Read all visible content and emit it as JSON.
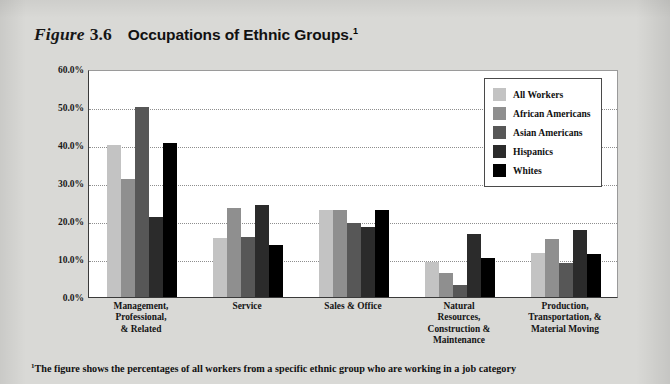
{
  "figure": {
    "label_word": "Figure",
    "number": "3.6",
    "title": "Occupations of Ethnic Groups.",
    "title_footnote_marker": "1"
  },
  "footnote": {
    "marker": "1",
    "text": "The figure shows the percentages of all workers from a specific ethnic group who are working in a job category"
  },
  "legend": {
    "position": "top-right",
    "items": [
      {
        "label": "All Workers",
        "color": "#c3c3c3"
      },
      {
        "label": "African Americans",
        "color": "#8f8f8f"
      },
      {
        "label": "Asian Americans",
        "color": "#575757"
      },
      {
        "label": "Hispanics",
        "color": "#2b2b2b"
      },
      {
        "label": "Whites",
        "color": "#000000"
      }
    ]
  },
  "chart_data": {
    "type": "bar",
    "title": "Occupations of Ethnic Groups.",
    "xlabel": "",
    "ylabel": "",
    "ylim": [
      0,
      60
    ],
    "ytick_labels": [
      "0.0%",
      "10.0%",
      "20.0%",
      "30.0%",
      "40.0%",
      "50.0%",
      "60.0%"
    ],
    "ytick_values": [
      0,
      10,
      20,
      30,
      40,
      50,
      60
    ],
    "grid": true,
    "categories": [
      "Management,\nProfessional,\n& Related",
      "Service",
      "Sales & Office",
      "Natural\nResources,\nConstruction &\nMaintenance",
      "Production,\nTransportation, &\nMaterial Moving"
    ],
    "series": [
      {
        "name": "All Workers",
        "color": "#c3c3c3",
        "values": [
          40.0,
          15.5,
          23.0,
          9.3,
          11.6
        ]
      },
      {
        "name": "African Americans",
        "color": "#8f8f8f",
        "values": [
          31.0,
          23.5,
          23.0,
          6.2,
          15.2
        ]
      },
      {
        "name": "Asian Americans",
        "color": "#575757",
        "values": [
          50.0,
          15.8,
          19.4,
          3.2,
          8.9
        ]
      },
      {
        "name": "Hispanics",
        "color": "#2b2b2b",
        "values": [
          21.0,
          24.3,
          18.5,
          16.5,
          17.6
        ]
      },
      {
        "name": "Whites",
        "color": "#000000",
        "values": [
          40.5,
          13.8,
          23.0,
          10.3,
          11.2
        ]
      }
    ]
  }
}
